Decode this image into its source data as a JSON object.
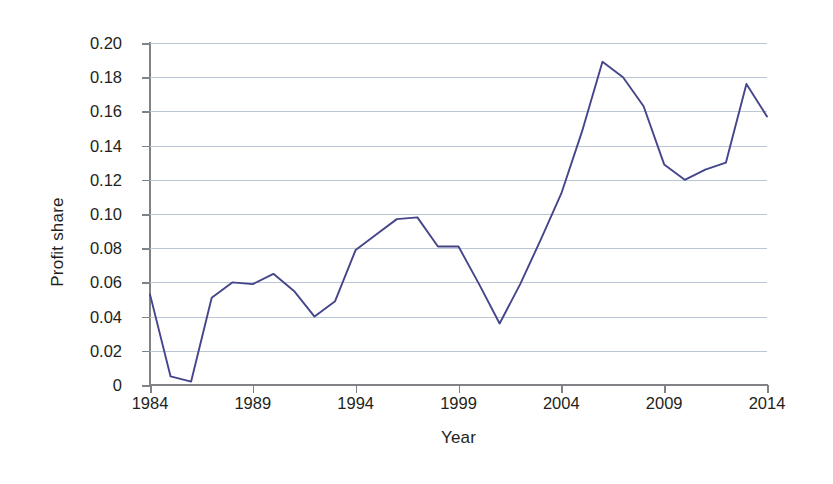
{
  "chart_data": {
    "type": "line",
    "title": "",
    "subtitle": "",
    "xlabel": "Year",
    "ylabel": "Profit share",
    "xlim": [
      1984,
      2014
    ],
    "ylim": [
      0,
      0.2
    ],
    "grid": true,
    "legend": false,
    "legend_position": "none",
    "line_color": "#45458a",
    "gridline_color": "#b9c6d6",
    "axis_color": "#808286",
    "x_tick_labels": [
      "1984",
      "1989",
      "1994",
      "1999",
      "2004",
      "2009",
      "2014"
    ],
    "x_tick_values": [
      1984,
      1989,
      1994,
      1999,
      2004,
      2009,
      2014
    ],
    "y_tick_labels": [
      "0.20",
      "0.18",
      "0.16",
      "0.14",
      "0.12",
      "0.10",
      "0.08",
      "0.06",
      "0.04",
      "0.02",
      "0"
    ],
    "y_tick_values": [
      0.2,
      0.18,
      0.16,
      0.14,
      0.12,
      0.1,
      0.08,
      0.06,
      0.04,
      0.02,
      0
    ],
    "x": [
      1984,
      1985,
      1986,
      1987,
      1988,
      1989,
      1990,
      1991,
      1992,
      1993,
      1994,
      1995,
      1996,
      1997,
      1998,
      1999,
      2000,
      2001,
      2002,
      2003,
      2004,
      2005,
      2006,
      2007,
      2008,
      2009,
      2010,
      2011,
      2012,
      2013,
      2014
    ],
    "series": [
      {
        "name": "Profit share",
        "values": [
          0.053,
          0.005,
          0.002,
          0.051,
          0.06,
          0.059,
          0.065,
          0.055,
          0.04,
          0.049,
          0.079,
          0.088,
          0.097,
          0.098,
          0.081,
          0.081,
          0.059,
          0.036,
          0.059,
          0.085,
          0.112,
          0.148,
          0.189,
          0.18,
          0.163,
          0.129,
          0.12,
          0.126,
          0.13,
          0.176,
          0.157
        ]
      }
    ]
  }
}
